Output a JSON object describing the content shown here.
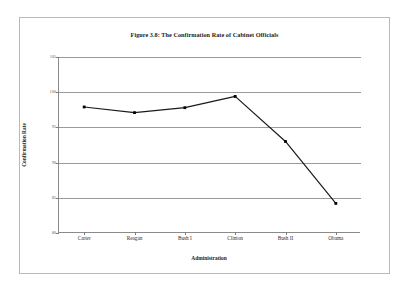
{
  "figure": {
    "title": "Figure 3.8: The Confirmation Rate of Cabinet Officials",
    "x_axis_title": "Administration",
    "y_axis_title": "Confirmation Rate"
  },
  "colors": {
    "page_border": "#b9b9b9",
    "gridline": "#9a9a9a",
    "axis": "#8a8a8a",
    "series_line": "#1a1a1a",
    "marker": "#000000",
    "background": "#ffffff",
    "title_text": "#1b1b1b",
    "tick_text": "#555555"
  },
  "chart_data": {
    "type": "line",
    "title": "Figure 3.8: The Confirmation Rate of Cabinet Officials",
    "xlabel": "Administration",
    "ylabel": "Confirmation Rate",
    "categories": [
      "Carter",
      "Reagan",
      "Bush I",
      "Clinton",
      "Bush II",
      "Obama"
    ],
    "values": [
      97.9,
      97.1,
      97.8,
      99.4,
      93.0,
      84.2
    ],
    "ylim": [
      80,
      105
    ],
    "yticks": [
      80,
      85,
      90,
      95,
      100,
      105
    ],
    "ytick_labels": [
      "80",
      "85",
      "90",
      "95",
      "100",
      "105"
    ],
    "grid": true,
    "legend": false,
    "marker": "square",
    "series": [
      {
        "name": "Confirmation Rate",
        "values": [
          97.9,
          97.1,
          97.8,
          99.4,
          93.0,
          84.2
        ]
      }
    ]
  }
}
